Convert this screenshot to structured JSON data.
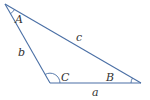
{
  "diagram": {
    "type": "triangle",
    "stroke_color": "#4a6fa5",
    "arc_color": "#4a6fa5",
    "label_color": "#333333",
    "vertices": {
      "A": {
        "x": 5,
        "y": 4
      },
      "C": {
        "x": 50,
        "y": 83
      },
      "B": {
        "x": 141,
        "y": 83
      }
    },
    "angle_labels": {
      "A": "A",
      "B": "B",
      "C": "C"
    },
    "side_labels": {
      "a": "a",
      "b": "b",
      "c": "c"
    }
  }
}
